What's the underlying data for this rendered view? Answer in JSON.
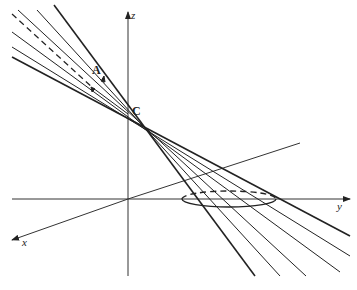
{
  "diagram": {
    "labels": {
      "z_axis": "z",
      "y_axis": "y",
      "x_axis": "x",
      "vertex": "C",
      "point_a": "A"
    },
    "colors": {
      "line": "#222222",
      "background": "#ffffff"
    },
    "elements": [
      "z-axis",
      "y-axis",
      "x-axis",
      "vertex C",
      "point A with arrows",
      "generator lines",
      "dashed generator",
      "base ellipse"
    ]
  }
}
